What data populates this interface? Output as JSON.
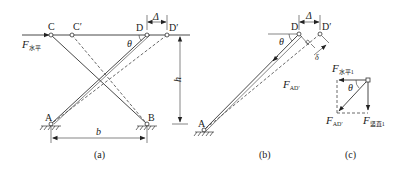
{
  "figure_a": {
    "caption": "(a)",
    "nodes": {
      "C": "C",
      "C_prime": "C′",
      "D": "D",
      "D_prime": "D′",
      "A": "A",
      "B": "B"
    },
    "force_label": "F",
    "force_sub": "水平",
    "theta": "θ",
    "delta": "Δ",
    "height": "h",
    "width": "b"
  },
  "figure_b": {
    "caption": "(b)",
    "nodes": {
      "D": "D",
      "D_prime": "D′",
      "A": "A"
    },
    "theta": "θ",
    "delta": "Δ",
    "small_delta": "δ",
    "force_label": "F",
    "force_sub": "AD′"
  },
  "figure_c": {
    "caption": "(c)",
    "theta": "θ",
    "force_horizontal": "F",
    "force_horizontal_sub": "水平1",
    "force_diag": "F",
    "force_diag_sub": "AD′",
    "force_vertical": "F",
    "force_vertical_sub": "竖直1"
  }
}
